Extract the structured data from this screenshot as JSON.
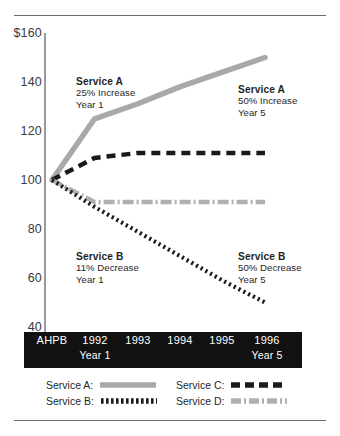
{
  "chart_data": {
    "type": "line",
    "title": "",
    "xlabel": "",
    "ylabel": "",
    "ylim": [
      40,
      160
    ],
    "yticks": [
      "$160",
      "140",
      "120",
      "100",
      "80",
      "60",
      "40"
    ],
    "ytick_values": [
      160,
      140,
      120,
      100,
      80,
      60,
      40
    ],
    "grid": false,
    "legend_position": "bottom",
    "categories": [
      "AHPB",
      "1992",
      "1993",
      "1994",
      "1995",
      "1996"
    ],
    "category_sublabels": [
      "",
      "Year 1",
      "",
      "",
      "",
      "Year 5"
    ],
    "series": [
      {
        "name": "Service A",
        "style": "solid-thick-gray",
        "color": "#a9a9a9",
        "values": [
          100,
          125,
          131,
          138,
          144,
          150
        ]
      },
      {
        "name": "Service B",
        "style": "dotted-black",
        "color": "#1a1a1a",
        "values": [
          100,
          89,
          79,
          69,
          59,
          50
        ]
      },
      {
        "name": "Service C",
        "style": "dashed-black",
        "color": "#1a1a1a",
        "values": [
          100,
          109,
          111,
          111,
          111,
          111
        ]
      },
      {
        "name": "Service D",
        "style": "dash-dot-gray",
        "color": "#b0b0b0",
        "values": [
          100,
          91,
          91,
          91,
          91,
          91
        ]
      }
    ],
    "annotations": [
      {
        "id": "a1",
        "series": "Service A",
        "heading": "Service A",
        "line1": "25% Increase",
        "line2": "Year 1"
      },
      {
        "id": "a5",
        "series": "Service A",
        "heading": "Service A",
        "line1": "50% Increase",
        "line2": "Year 5"
      },
      {
        "id": "b1",
        "series": "Service B",
        "heading": "Service B",
        "line1": "11% Decrease",
        "line2": "Year 1"
      },
      {
        "id": "b5",
        "series": "Service B",
        "heading": "Service B",
        "line1": "50% Decrease",
        "line2": "Year 5"
      }
    ],
    "legend": [
      {
        "label": "Service A:",
        "swatch": "solid-thick-gray"
      },
      {
        "label": "Service B:",
        "swatch": "dotted-black"
      },
      {
        "label": "Service C:",
        "swatch": "dashed-black"
      },
      {
        "label": "Service D:",
        "swatch": "dash-dot-gray"
      }
    ]
  },
  "colors": {
    "service_a": "#a9a9a9",
    "service_b": "#1a1a1a",
    "service_c": "#1a1a1a",
    "service_d": "#b0b0b0",
    "axis": "#9a9a9a",
    "band_background": "#111111",
    "band_text": "#ffffff",
    "rule": "#6b6b6b"
  }
}
